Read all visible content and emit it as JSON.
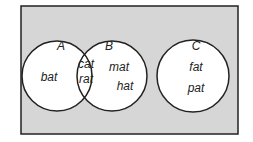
{
  "diagram": {
    "type": "venn",
    "universe": {
      "fill": "#d6d6d6",
      "stroke": "#222222"
    },
    "sets": [
      {
        "name": "A",
        "only": [
          "bat"
        ]
      },
      {
        "name": "B",
        "only": [
          "mat",
          "hat"
        ]
      },
      {
        "name": "C",
        "only": [
          "fat",
          "pat"
        ]
      }
    ],
    "intersection_AB": [
      "cat",
      "rat"
    ],
    "labels": {
      "A": "A",
      "B": "B",
      "C": "C",
      "bat": "bat",
      "cat": "cat",
      "rat": "rat",
      "mat": "mat",
      "hat": "hat",
      "fat": "fat",
      "pat": "pat"
    }
  }
}
